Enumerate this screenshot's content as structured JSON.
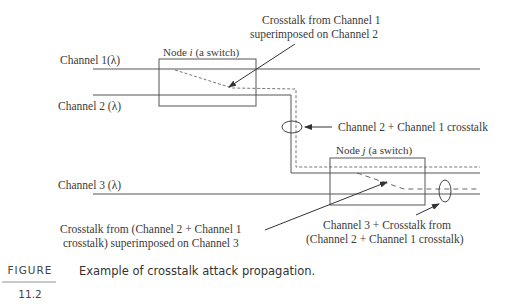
{
  "figure": {
    "label": "FIGURE",
    "number": "11.2",
    "caption": "Example of crosstalk attack propagation."
  },
  "channels": [
    {
      "id": "ch1",
      "label": "Channel 1(λ)"
    },
    {
      "id": "ch2",
      "label": "Channel 2 (λ)"
    },
    {
      "id": "ch3",
      "label": "Channel 3 (λ)"
    }
  ],
  "nodes": [
    {
      "id": "node_i",
      "label_prefix": "Node ",
      "label_var": "i",
      "label_suffix": " (a switch)"
    },
    {
      "id": "node_j",
      "label_prefix": "Node ",
      "label_var": "j",
      "label_suffix": " (a switch)"
    }
  ],
  "annotations": {
    "crosstalk_ch1_line1": "Crosstalk from Channel 1",
    "crosstalk_ch1_line2": "superimposed on Channel 2",
    "ch2_plus_ch1": "Channel 2 + Channel 1 crosstalk",
    "crosstalk_ch3_line1": "Crosstalk from (Channel 2 + Channel 1",
    "crosstalk_ch3_line2": "crosstalk) superimposed on Channel 3",
    "ch3_result_line1": "Channel 3 + Crosstalk from",
    "ch3_result_line2": "(Channel 2 + Channel 1 crosstalk)"
  },
  "colors": {
    "line": "#555555",
    "text": "#3a3a3a"
  }
}
